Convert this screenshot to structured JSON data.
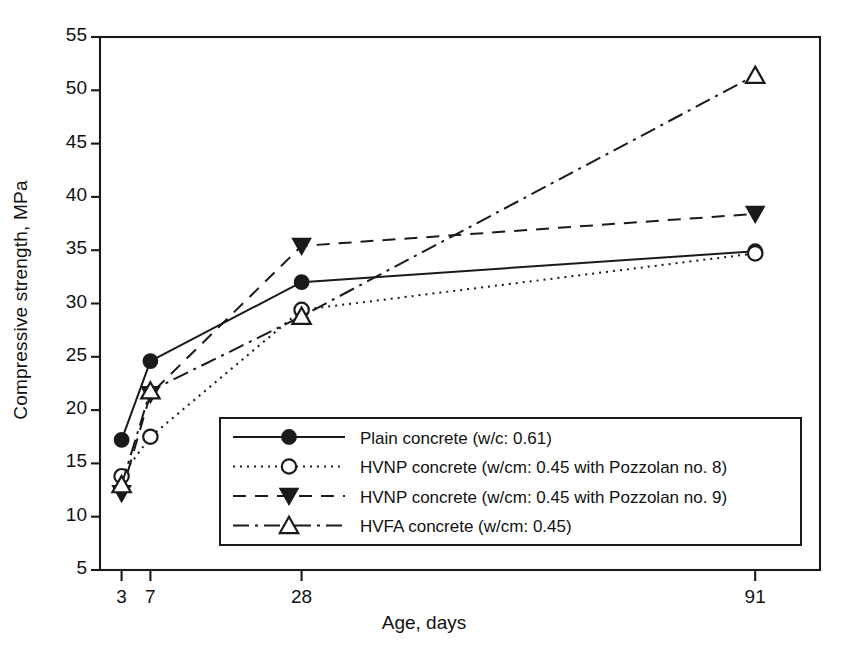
{
  "chart_data": {
    "type": "line",
    "title": "",
    "xlabel": "Age, days",
    "ylabel": "Compressive strength, MPa",
    "x": [
      3,
      7,
      28,
      91
    ],
    "xtick_labels": [
      "3",
      "7",
      "28",
      "91"
    ],
    "ytick_labels": [
      "5",
      "10",
      "15",
      "20",
      "25",
      "30",
      "35",
      "40",
      "45",
      "50",
      "55"
    ],
    "ytick_values": [
      5,
      10,
      15,
      20,
      25,
      30,
      35,
      40,
      45,
      50,
      55
    ],
    "ylim": [
      5,
      55
    ],
    "xlim": [
      0,
      100
    ],
    "grid": false,
    "legend_position": "lower-center-right",
    "series": [
      {
        "name": "Plain concrete (w/c: 0.61)",
        "values": [
          17.2,
          24.6,
          32.0,
          34.9
        ],
        "marker": "filled-circle",
        "line_style": "solid",
        "color": "#1a1a1a"
      },
      {
        "name": "HVNP concrete (w/cm: 0.45 with Pozzolan no. 8)",
        "values": [
          13.8,
          17.5,
          29.4,
          34.7
        ],
        "marker": "open-circle",
        "line_style": "dotted",
        "color": "#1a1a1a"
      },
      {
        "name": "HVNP concrete (w/cm: 0.45 with Pozzolan no. 9)",
        "values": [
          12.2,
          21.5,
          35.4,
          38.4
        ],
        "marker": "filled-triangle-down",
        "line_style": "dashed",
        "color": "#1a1a1a"
      },
      {
        "name": "HVFA concrete (w/cm: 0.45)",
        "values": [
          13.0,
          21.8,
          28.8,
          51.4
        ],
        "marker": "open-triangle-up",
        "line_style": "dash-dot",
        "color": "#1a1a1a"
      }
    ]
  },
  "axes": {
    "y_title": "Compressive strength, MPa",
    "x_title": "Age, days"
  },
  "legend": {
    "entries": [
      {
        "label": "Plain concrete (w/c: 0.61)"
      },
      {
        "label": "HVNP concrete (w/cm: 0.45 with Pozzolan no. 8)"
      },
      {
        "label": "HVNP concrete (w/cm: 0.45 with Pozzolan no. 9)"
      },
      {
        "label": "HVFA concrete (w/cm: 0.45)"
      }
    ]
  },
  "colors": {
    "ink": "#1a1a1a",
    "background": "#ffffff"
  }
}
